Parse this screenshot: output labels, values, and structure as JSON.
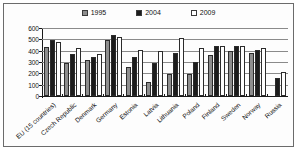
{
  "legend": {
    "items": [
      {
        "label": "1995",
        "color": "#8e8e8e"
      },
      {
        "label": "2004",
        "color": "#1c1c1c"
      },
      {
        "label": "2009",
        "color": "#ffffff"
      }
    ]
  },
  "axis": {
    "yticks": [
      "600",
      "500",
      "400",
      "300",
      "200",
      "100",
      "0"
    ]
  },
  "chart_data": {
    "type": "bar",
    "title": "",
    "xlabel": "",
    "ylabel": "",
    "ylim": [
      0,
      600
    ],
    "ytick_step": 100,
    "grid": true,
    "legend_position": "top-center",
    "categories": [
      "EU (15 countries)",
      "Czech Republic",
      "Denmark",
      "Germany",
      "Estonia",
      "Latvia",
      "Lithuania",
      "Poland",
      "Finland",
      "Sweden",
      "Norway",
      "Russia"
    ],
    "series": [
      {
        "name": "1995",
        "color": "#8e8e8e",
        "values": [
          430,
          295,
          320,
          490,
          260,
          125,
          195,
          190,
          360,
          395,
          380,
          null
        ]
      },
      {
        "name": "2004",
        "color": "#1c1c1c",
        "values": [
          495,
          370,
          345,
          535,
          345,
          290,
          380,
          300,
          440,
          440,
          410,
          155
        ]
      },
      {
        "name": "2009",
        "color": "#ffffff",
        "values": [
          480,
          420,
          370,
          520,
          405,
          395,
          510,
          420,
          440,
          440,
          425,
          215
        ]
      }
    ]
  }
}
